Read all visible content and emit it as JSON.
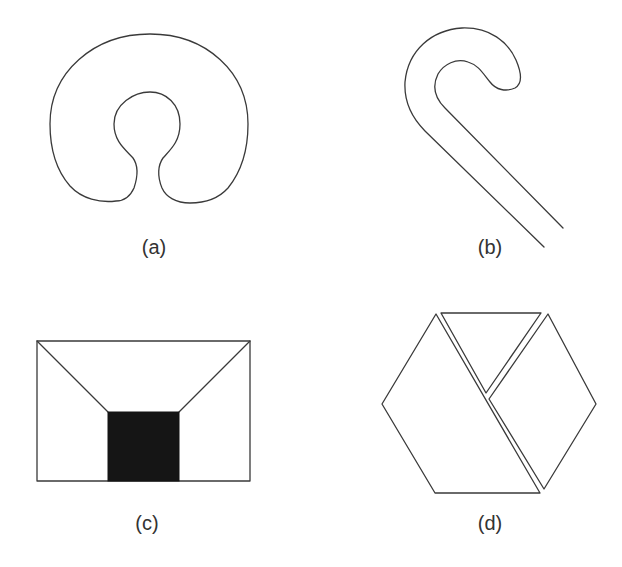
{
  "panels": [
    {
      "id": "a",
      "label": "(a)",
      "description": "horseshoe / C-shaped region with a narrow neck opening at the bottom"
    },
    {
      "id": "b",
      "label": "(b)",
      "description": "cane / hook-shaped open curve"
    },
    {
      "id": "c",
      "label": "(c)",
      "description": "rectangle with diagonals from top corners to a filled black square at the bottom center"
    },
    {
      "id": "d",
      "label": "(d)",
      "description": "hexagon split into three pieces: a large left parallelogram, a top triangle and a right parallelogram"
    }
  ],
  "colors": {
    "stroke": "#3a3a3a",
    "fill": "#151515",
    "background": "#ffffff"
  }
}
